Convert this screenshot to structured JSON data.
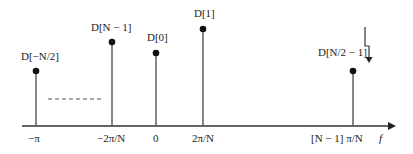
{
  "diagram": {
    "title": "",
    "axis": {
      "label": "f"
    },
    "stems": [
      {
        "id": "neg-half",
        "label": "D[−N/2]",
        "tick": "−π"
      },
      {
        "id": "n-minus-1",
        "label": "D[N − 1]",
        "tick": "−2π/N"
      },
      {
        "id": "zero",
        "label": "D[0]",
        "tick": "0"
      },
      {
        "id": "one",
        "label": "D[1]",
        "tick": "2π/N"
      },
      {
        "id": "half-minus-1",
        "label": "D[N/2 − 1]",
        "tick": "[N − 1] π/N"
      }
    ],
    "ellipsis": "dashed"
  },
  "colors": {
    "line": "#555555",
    "dot": "#111111",
    "text": "#222222"
  }
}
